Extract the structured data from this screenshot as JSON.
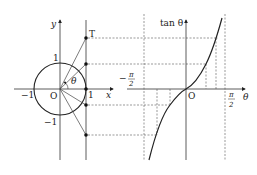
{
  "figure": {
    "left_plot": {
      "y_axis_label": "y",
      "x_axis_label": "x",
      "origin_label": "O",
      "tick_x_neg": "−1",
      "tick_x_pos": "1",
      "tick_y_pos": "1",
      "tick_y_neg": "−1",
      "point_label_T": "T",
      "angle_label": "θ"
    },
    "right_plot": {
      "y_axis_label": "tan θ",
      "x_axis_label": "θ",
      "origin_label": "O",
      "neg_half_pi_sign": "−",
      "half_pi_num": "π",
      "half_pi_den": "2"
    },
    "colors": {
      "line": "#333333",
      "dashed": "#555555",
      "background": "#ffffff"
    }
  }
}
